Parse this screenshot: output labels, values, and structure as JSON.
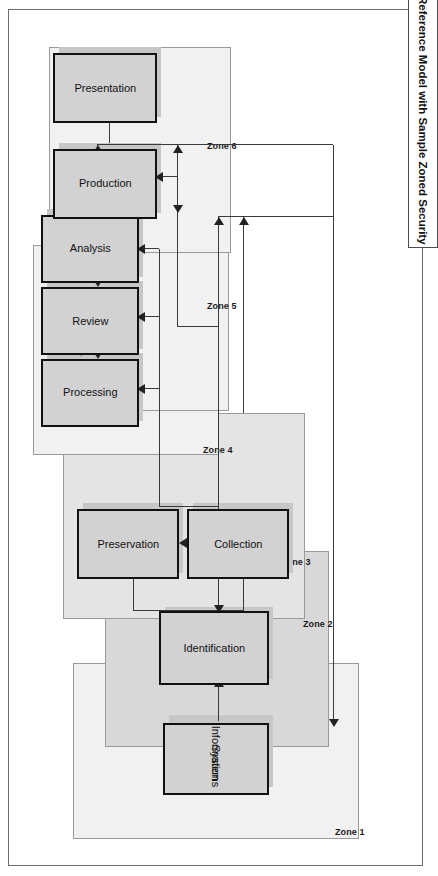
{
  "document": {
    "title": "The Electronic Discovery Reference Model with Sample Zoned Security"
  },
  "diagram": {
    "orientation": "rotated-90",
    "nodes": [
      {
        "id": "information-systems",
        "label": "Information\nSystems",
        "line1": "Information",
        "line2": "Systems"
      },
      {
        "id": "identification",
        "label": "Identification"
      },
      {
        "id": "preservation",
        "label": "Preservation"
      },
      {
        "id": "collection",
        "label": "Collection"
      },
      {
        "id": "processing",
        "label": "Processing"
      },
      {
        "id": "review",
        "label": "Review"
      },
      {
        "id": "analysis",
        "label": "Analysis"
      },
      {
        "id": "production",
        "label": "Production"
      },
      {
        "id": "presentation",
        "label": "Presentation"
      }
    ],
    "zones": [
      {
        "id": "zone-1",
        "label": "Zone 1"
      },
      {
        "id": "zone-2",
        "label": "Zone 2"
      },
      {
        "id": "zone-3",
        "label": "Zone 3"
      },
      {
        "id": "zone-4",
        "label": "Zone 4"
      },
      {
        "id": "zone-5",
        "label": "Zone 5"
      },
      {
        "id": "zone-6",
        "label": "Zone 6"
      }
    ],
    "colors": {
      "node_fill": "#d2d2d2",
      "node_border": "#111111",
      "node_shadow": "#c7c7c7",
      "zone_light": "#f1f1f1",
      "zone_medium": "#e4e4e4",
      "zone_dark": "#d8d8d8",
      "zone_border": "#9a9a9a",
      "connector": "#3a3a3a",
      "page_border": "#6d6d6d",
      "text": "#111111",
      "background": "#ffffff"
    }
  }
}
